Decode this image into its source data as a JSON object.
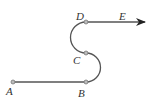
{
  "diagram": {
    "points": [
      {
        "id": "A",
        "label": "A"
      },
      {
        "id": "B",
        "label": "B"
      },
      {
        "id": "C",
        "label": "C"
      },
      {
        "id": "D",
        "label": "D"
      },
      {
        "id": "E",
        "label": "E"
      }
    ],
    "segments": [
      {
        "from": "A",
        "to": "B",
        "type": "line"
      },
      {
        "from": "B",
        "to": "C",
        "type": "semicircle"
      },
      {
        "from": "C",
        "to": "D",
        "type": "semicircle"
      },
      {
        "from": "D",
        "to": "E",
        "type": "arrow"
      }
    ],
    "colors": {
      "line": "#555555",
      "arrow": "#222222",
      "point": "#bbbbbb"
    }
  }
}
